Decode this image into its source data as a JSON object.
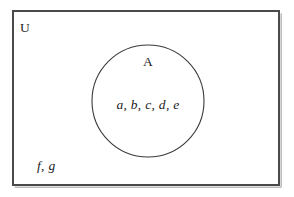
{
  "diagram": {
    "type": "venn-diagram",
    "background_color": "#ffffff",
    "stroke_color": "#3c3c3c",
    "shadow_color": "#b8b8b8",
    "text_color": "#1a1a1a",
    "universe": {
      "label": "U",
      "shape": "rectangle",
      "x": 13,
      "y": 11,
      "width": 266,
      "height": 174
    },
    "set_a": {
      "label": "A",
      "shape": "circle",
      "cx": 148,
      "cy": 101,
      "r": 56,
      "members": "a, b, c, d, e"
    },
    "outside_members": "f, g"
  }
}
